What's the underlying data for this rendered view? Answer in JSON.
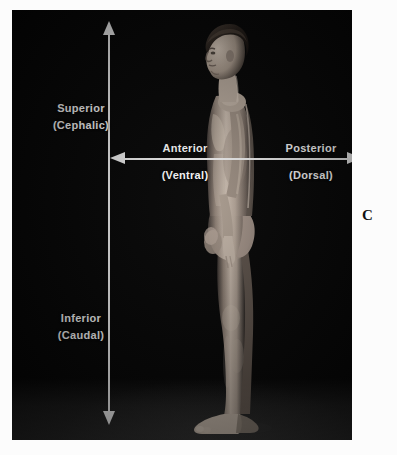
{
  "figure": {
    "panel_letter": "C",
    "caption_title": "Directional terms of the body (lateral view)",
    "view": "lateral (side) view of a standing male subject",
    "background_color": "#0a0a0a",
    "label_color": "#ffffff",
    "arrow_color": "#f2f2f2"
  },
  "axes": {
    "vertical": {
      "name": "superior-inferior-axis",
      "top": {
        "term": "Superior",
        "alt": "(Cephalic)"
      },
      "bottom": {
        "term": "Inferior",
        "alt": "(Caudal)"
      }
    },
    "horizontal": {
      "name": "anterior-posterior-axis",
      "left": {
        "term": "Anterior",
        "alt": "(Ventral)"
      },
      "right": {
        "term": "Posterior",
        "alt": "(Dorsal)"
      }
    }
  },
  "icons": {
    "arrow_up": "arrow-up-icon",
    "arrow_down": "arrow-down-icon",
    "arrow_left": "arrow-left-icon",
    "arrow_right": "arrow-right-icon"
  }
}
